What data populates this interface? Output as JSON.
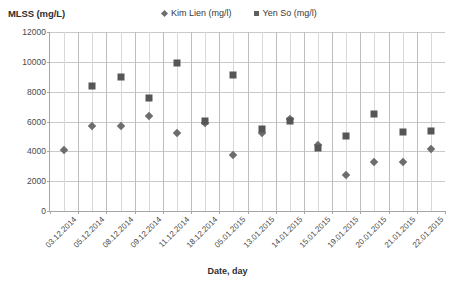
{
  "chart_data": {
    "type": "scatter",
    "title": "",
    "ylabel": "MLSS (mg/L)",
    "xlabel": "Date, day",
    "ylim": [
      0,
      12000
    ],
    "ytick_step": 2000,
    "yticks": [
      "0",
      "2000",
      "4000",
      "6000",
      "8000",
      "10000",
      "12000"
    ],
    "grid": true,
    "legend_position": "top-center",
    "categories": [
      "03.12.2014",
      "05.12.2014",
      "08.12.2014",
      "09.12.2014",
      "11.12.2014",
      "18.12.2014",
      "05.01.2015",
      "13.01.2015",
      "14.01.2015",
      "15.01.2015",
      "19.01.2015",
      "20.01.2015",
      "21.01.2015",
      "22.01.2015"
    ],
    "series": [
      {
        "name": "Kim Lien (mg/l)",
        "marker": "diamond",
        "color": "#6d6d6d",
        "values": [
          4100,
          5700,
          5700,
          6350,
          5200,
          5900,
          3750,
          5200,
          6150,
          4450,
          2400,
          3300,
          3300,
          4150
        ]
      },
      {
        "name": "Yen So (mg/l)",
        "marker": "square",
        "color": "#565656",
        "values": [
          null,
          8350,
          9000,
          7550,
          9900,
          6050,
          9100,
          5500,
          6050,
          4200,
          5000,
          6500,
          5300,
          5350
        ]
      }
    ]
  },
  "legend": {
    "entries": [
      {
        "label": "Kim Lien (mg/l)",
        "marker": "diamond-marker-icon"
      },
      {
        "label": "Yen So (mg/l)",
        "marker": "square-marker-icon"
      }
    ]
  },
  "colors": {
    "series_kim_lien": "#6d6d6d",
    "series_yen_so": "#565656",
    "gridline": "#c9c9c9",
    "axis": "#a6a6a6",
    "text": "#3f3f3f"
  }
}
